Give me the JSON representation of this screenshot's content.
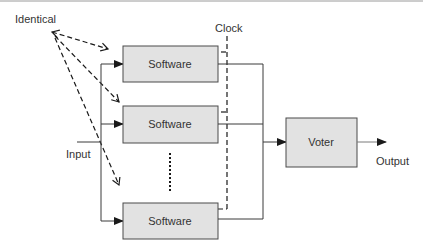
{
  "diagram": {
    "labels": {
      "identical": "Identical",
      "clock": "Clock",
      "input": "Input",
      "output": "Output"
    },
    "software_boxes": [
      {
        "label": "Software"
      },
      {
        "label": "Software"
      },
      {
        "label": "Software"
      }
    ],
    "voter": {
      "label": "Voter"
    },
    "colors": {
      "box_fill": "#e2e2e2",
      "box_stroke": "#4a4a4a",
      "line": "#3a3a3a",
      "text": "#333333",
      "top_rule": "#9a9a9a"
    }
  }
}
